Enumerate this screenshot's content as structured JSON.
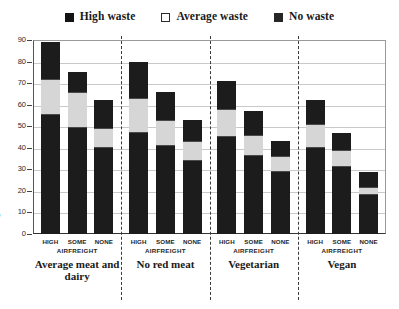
{
  "legend": {
    "items": [
      {
        "label": "High waste",
        "key": "high",
        "color": "#1c1c1c"
      },
      {
        "label": "Average waste",
        "key": "average",
        "color": "#ffffff"
      },
      {
        "label": "No waste",
        "key": "none",
        "color": "#262626"
      }
    ]
  },
  "axis": {
    "y_title": "kgCO",
    "y_title_sub": "2",
    "y_title_tail": "e",
    "y_ticks": [
      90,
      80,
      70,
      60,
      50,
      40,
      30,
      20,
      10,
      0
    ],
    "x_sub_label": "AIRFREIGHT"
  },
  "chart_data": {
    "type": "bar",
    "stacked": true,
    "title": "",
    "xlabel": "",
    "ylabel": "kgCO2e",
    "ylim": [
      0,
      90
    ],
    "ytick_step": 10,
    "grid": true,
    "legend_position": "top-center",
    "series": [
      {
        "name": "No waste",
        "key": "no"
      },
      {
        "name": "Average waste",
        "key": "average"
      },
      {
        "name": "High waste",
        "key": "high"
      }
    ],
    "groups": [
      {
        "label": "Average meat and dairy",
        "bars": [
          {
            "category": "HIGH",
            "no": 55,
            "average": 17,
            "high": 17,
            "total": 89
          },
          {
            "category": "SOME",
            "no": 49,
            "average": 17,
            "high": 9,
            "total": 75
          },
          {
            "category": "NONE",
            "no": 40,
            "average": 9,
            "high": 13,
            "total": 62
          }
        ]
      },
      {
        "label": "No red meat",
        "bars": [
          {
            "category": "HIGH",
            "no": 47,
            "average": 16,
            "high": 17,
            "total": 80
          },
          {
            "category": "SOME",
            "no": 41,
            "average": 12,
            "high": 13,
            "total": 66
          },
          {
            "category": "NONE",
            "no": 34,
            "average": 9,
            "high": 10,
            "total": 53
          }
        ]
      },
      {
        "label": "Vegetarian",
        "bars": [
          {
            "category": "HIGH",
            "no": 45,
            "average": 13,
            "high": 13,
            "total": 71
          },
          {
            "category": "SOME",
            "no": 36,
            "average": 10,
            "high": 11,
            "total": 57
          },
          {
            "category": "NONE",
            "no": 29,
            "average": 7,
            "high": 7,
            "total": 43
          }
        ]
      },
      {
        "label": "Vegan",
        "bars": [
          {
            "category": "HIGH",
            "no": 40,
            "average": 11,
            "high": 11,
            "total": 62
          },
          {
            "category": "SOME",
            "no": 31,
            "average": 8,
            "high": 8,
            "total": 47
          },
          {
            "category": "NONE",
            "no": 18,
            "average": 4,
            "high": 7,
            "total": 29
          }
        ]
      }
    ]
  }
}
